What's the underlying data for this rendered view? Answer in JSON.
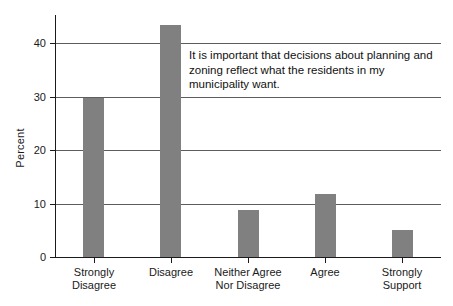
{
  "chart_data": {
    "type": "bar",
    "title": "",
    "subtitle": "",
    "xlabel": "",
    "ylabel": "Percent",
    "ylim": [
      0,
      45
    ],
    "yticks": [
      0,
      10,
      20,
      30,
      40
    ],
    "ytick_labels": [
      "0",
      "10",
      "20",
      "30",
      "40"
    ],
    "grid": true,
    "legend": false,
    "legend_position": "none",
    "categories": [
      "Strongly\nDisagree",
      "Disagree",
      "Neither Agree\nNor Disagree",
      "Agree",
      "Strongly\nSupport"
    ],
    "values": [
      29.8,
      43.4,
      8.7,
      11.8,
      5.0
    ],
    "bar_color": "#808080",
    "annotations": [
      "It is important that decisions about planning and zoning reflect what the residents in my municipality want."
    ]
  },
  "axis": {
    "y_title": "Percent",
    "ticks": [
      {
        "label": "40",
        "value": 40
      },
      {
        "label": "30",
        "value": 30
      },
      {
        "label": "20",
        "value": 20
      },
      {
        "label": "10",
        "value": 10
      },
      {
        "label": "0",
        "value": 0
      }
    ]
  },
  "bars": [
    {
      "label": "Strongly\nDisagree",
      "value": 29.8
    },
    {
      "label": "Disagree",
      "value": 43.4
    },
    {
      "label": "Neither Agree\nNor Disagree",
      "value": 8.7
    },
    {
      "label": "Agree",
      "value": 11.8
    },
    {
      "label": "Strongly\nSupport",
      "value": 5.0
    }
  ],
  "annotation": {
    "text": "It is important that decisions about planning and zoning reflect what the residents in my municipality want."
  },
  "colors": {
    "bar_fill": "#808080",
    "axis": "#1a1a1a",
    "gridline": "#5d5d5d",
    "background": "#ffffff"
  }
}
